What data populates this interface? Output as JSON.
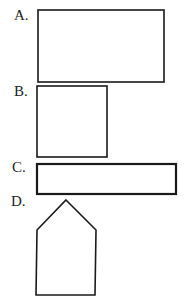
{
  "options": [
    {
      "label": "A.",
      "shape": "rectangle-wide",
      "x": 38,
      "y": 10,
      "w": 126,
      "h": 72
    },
    {
      "label": "B.",
      "shape": "square",
      "x": 37,
      "y": 86,
      "w": 70,
      "h": 71
    },
    {
      "label": "C.",
      "shape": "rectangle-long-thin",
      "x": 37,
      "y": 164,
      "w": 139,
      "h": 30
    },
    {
      "label": "D.",
      "shape": "pentagon-house",
      "points": "66,200 96,230 95,295 36,295 37,230"
    }
  ],
  "colors": {
    "stroke": "#1a1a1a",
    "background": "#ffffff"
  }
}
